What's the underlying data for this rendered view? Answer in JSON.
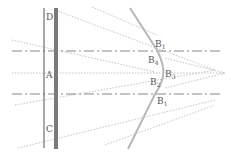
{
  "diagram": {
    "type": "optics ray diagram",
    "colors": {
      "background": "#ffffff",
      "thin_line": "#555555",
      "thick_bar": "#7a7a7a",
      "dash_dot": "#888888",
      "dotted": "#bbbbbb",
      "curve": "#b8b8b8",
      "label": "#555555"
    },
    "left_labels": {
      "D": "D",
      "A": "A",
      "C": "C"
    },
    "right_labels": {
      "b1_top": {
        "base": "B",
        "sub": "1"
      },
      "b4": {
        "base": "B",
        "sub": "4"
      },
      "b3": {
        "base": "B",
        "sub": "3"
      },
      "b2": {
        "base": "B",
        "sub": "2"
      },
      "b1_bottom": {
        "base": "B",
        "sub": "1"
      }
    }
  }
}
